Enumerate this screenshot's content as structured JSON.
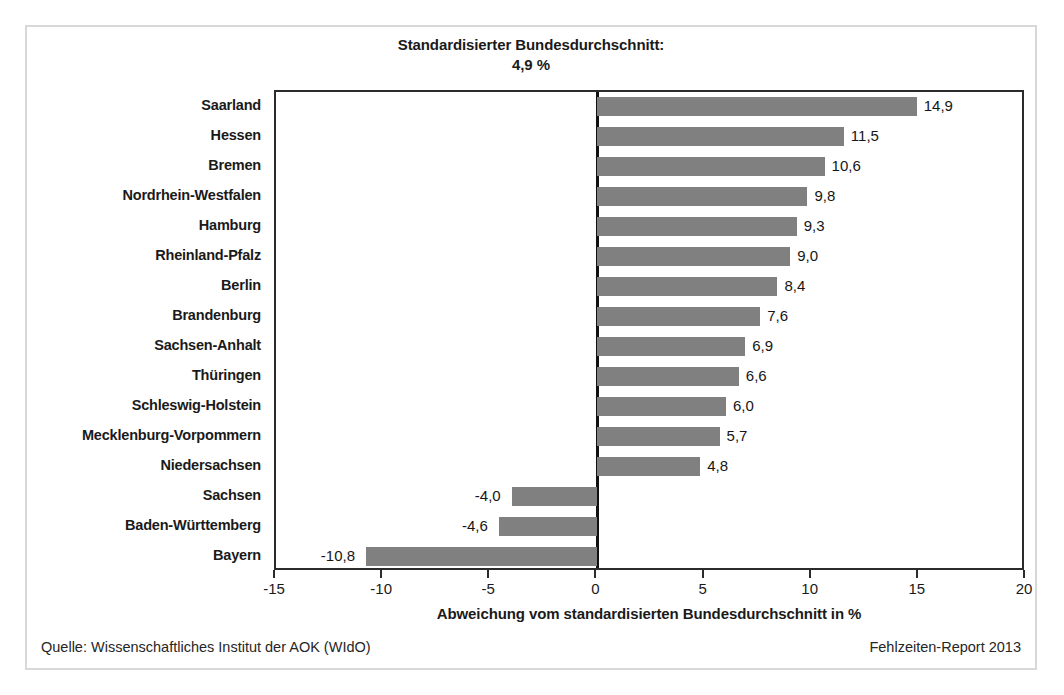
{
  "title": {
    "line1": "Standardisierter Bundesdurchschnitt:",
    "line2": "4,9 %"
  },
  "footer": {
    "source": "Quelle: Wissenschaftliches Institut der AOK (WIdO)",
    "report": "Fehlzeiten-Report 2013"
  },
  "style": {
    "bar_color": "#808080",
    "axis_color": "#2b2b2b",
    "frame_color": "#d8d8d8",
    "text_color": "#1a1a1a"
  },
  "chart_data": {
    "type": "bar",
    "orientation": "horizontal",
    "title": "Standardisierter Bundesdurchschnitt: 4,9 %",
    "xlabel": "Abweichung vom standardisierten Bundesdurchschnitt in %",
    "ylabel": "",
    "xlim": [
      -15,
      20
    ],
    "xticks": [
      -15,
      -10,
      -5,
      0,
      5,
      10,
      15,
      20
    ],
    "xticklabels": [
      "-15",
      "-10",
      "-5",
      "0",
      "5",
      "10",
      "15",
      "20"
    ],
    "grid": false,
    "legend": null,
    "reference_line": 0,
    "categories": [
      "Saarland",
      "Hessen",
      "Bremen",
      "Nordrhein-Westfalen",
      "Hamburg",
      "Rheinland-Pfalz",
      "Berlin",
      "Brandenburg",
      "Sachsen-Anhalt",
      "Thüringen",
      "Schleswig-Holstein",
      "Mecklenburg-Vorpommern",
      "Niedersachsen",
      "Sachsen",
      "Baden-Württemberg",
      "Bayern"
    ],
    "values": [
      14.9,
      11.5,
      10.6,
      9.8,
      9.3,
      9.0,
      8.4,
      7.6,
      6.9,
      6.6,
      6.0,
      5.7,
      4.8,
      -4.0,
      -4.6,
      -10.8
    ],
    "value_labels": [
      "14,9",
      "11,5",
      "10,6",
      "9,8",
      "9,3",
      "9,0",
      "8,4",
      "7,6",
      "6,9",
      "6,6",
      "6,0",
      "5,7",
      "4,8",
      "-4,0",
      "-4,6",
      "-10,8"
    ]
  }
}
